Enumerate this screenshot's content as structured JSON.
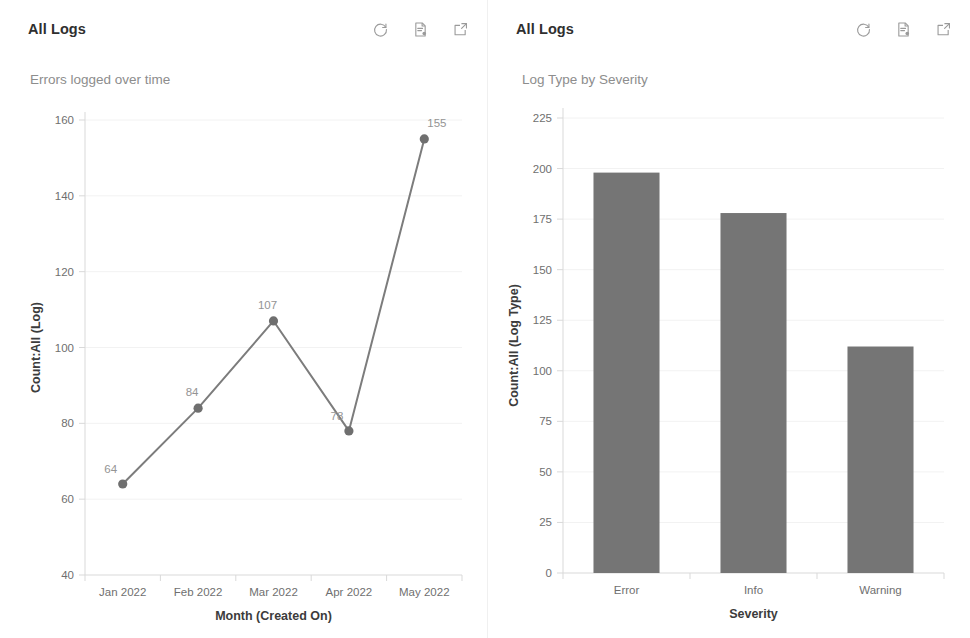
{
  "panels": [
    {
      "title": "All Logs",
      "subtitle": "Errors logged over time",
      "actions": [
        {
          "name": "refresh-icon",
          "label": "Refresh"
        },
        {
          "name": "report-icon",
          "label": "Run Report"
        },
        {
          "name": "popout-icon",
          "label": "Open in new window"
        }
      ]
    },
    {
      "title": "All Logs",
      "subtitle": "Log Type by Severity",
      "actions": [
        {
          "name": "refresh-icon",
          "label": "Refresh"
        },
        {
          "name": "report-icon",
          "label": "Run Report"
        },
        {
          "name": "popout-icon",
          "label": "Open in new window"
        }
      ]
    }
  ],
  "chart_data": [
    {
      "type": "line",
      "title": "Errors logged over time",
      "categories": [
        "Jan 2022",
        "Feb 2022",
        "Mar 2022",
        "Apr 2022",
        "May 2022"
      ],
      "values": [
        64,
        84,
        107,
        78,
        155
      ],
      "point_labels": [
        "64",
        "84",
        "107",
        "78",
        "155"
      ],
      "xlabel": "Month (Created On)",
      "ylabel": "Count:All (Log)",
      "ylim": [
        40,
        160
      ],
      "yticks": [
        40,
        60,
        80,
        100,
        120,
        140,
        160
      ],
      "ytick_labels": [
        "40",
        "60",
        "80",
        "100",
        "120",
        "140",
        "160"
      ],
      "grid": true,
      "legend": false,
      "series_color": "#7c7c7c",
      "marker_color": "#6f6f6f"
    },
    {
      "type": "bar",
      "title": "Log Type by Severity",
      "categories": [
        "Error",
        "Info",
        "Warning"
      ],
      "values": [
        198,
        178,
        112
      ],
      "xlabel": "Severity",
      "ylabel": "Count:All (Log Type)",
      "ylim": [
        0,
        225
      ],
      "yticks": [
        0,
        25,
        50,
        75,
        100,
        125,
        150,
        175,
        200,
        225
      ],
      "ytick_labels": [
        "0",
        "25",
        "50",
        "75",
        "100",
        "125",
        "150",
        "175",
        "200",
        "225"
      ],
      "grid": true,
      "legend": false,
      "bar_color": "#757575"
    }
  ]
}
